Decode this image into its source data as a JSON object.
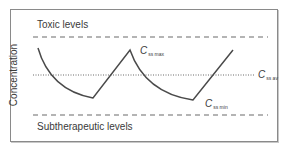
{
  "diagram": {
    "y_axis_label": "Concentration",
    "upper_band_label": "Toxic levels",
    "lower_band_label": "Subtherapeutic levels",
    "labels": {
      "c_max": {
        "main": "C",
        "sub": "ss max"
      },
      "c_av": {
        "main": "C",
        "sub": "ss av"
      },
      "c_min": {
        "main": "C",
        "sub": "ss min"
      }
    },
    "colors": {
      "curve": "#4a4a4a",
      "dashed_lines": "#6a6a6a",
      "dotted_line": "#6a6a6a",
      "frame": "#8a8a8a"
    }
  }
}
